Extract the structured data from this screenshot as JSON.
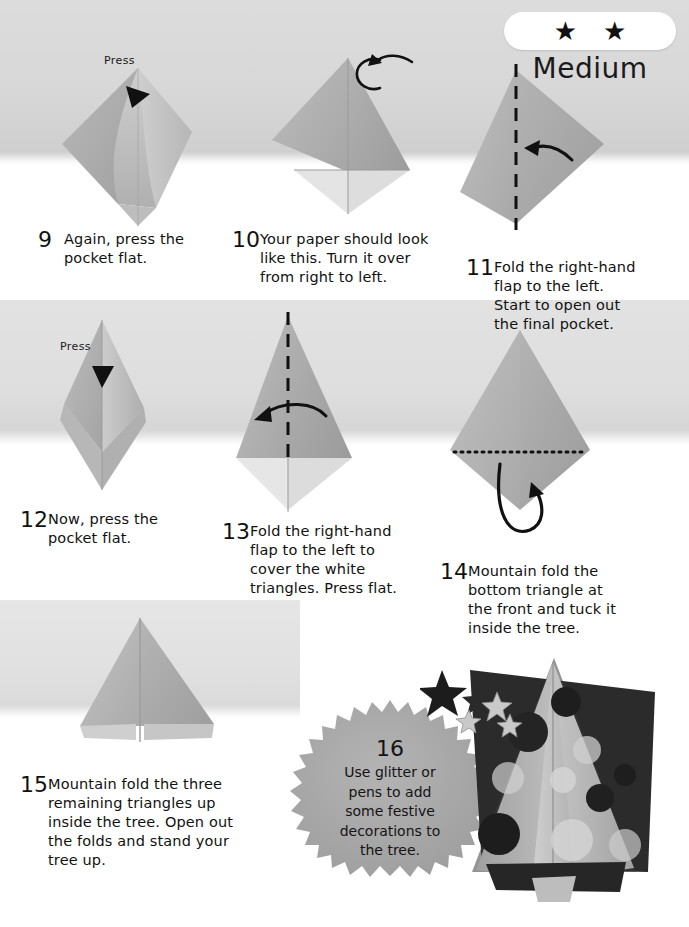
{
  "difficulty": {
    "label": "Medium",
    "stars": 2,
    "star_glyph": "★"
  },
  "steps": [
    {
      "number": "9",
      "text": "Again, press the\npocket flat.",
      "annotation": "Press"
    },
    {
      "number": "10",
      "text": "Your paper should look\nlike this. Turn it over\nfrom right to left.",
      "annotation": "turn-over-arrow"
    },
    {
      "number": "11",
      "text": "Fold the right-hand\nflap to the left.\nStart to open out\nthe final pocket.",
      "annotation": "valley-fold-line"
    },
    {
      "number": "12",
      "text": "Now, press the\npocket flat.",
      "annotation": "Press"
    },
    {
      "number": "13",
      "text": "Fold the right-hand\nflap to the left to\ncover the white\ntriangles. Press flat.",
      "annotation": "valley-fold-line"
    },
    {
      "number": "14",
      "text": "Mountain fold the\nbottom triangle at\nthe front and tuck it\ninside the tree.",
      "annotation": "mountain-fold-line"
    },
    {
      "number": "15",
      "text": "Mountain fold the three\nremaining triangles up\ninside the tree. Open out\nthe folds and stand your\ntree up.",
      "annotation": ""
    }
  ],
  "callout": {
    "number": "16",
    "text": "Use glitter or\npens to add\nsome festive\ndecorations to\nthe tree."
  },
  "colors": {
    "paper_light": "#c9c9c9",
    "paper_mid": "#b4b4b4",
    "paper_dark": "#9b9b9b",
    "paper_white": "#e9e9e9",
    "backdrop": "#d8d8d8",
    "ink": "#111111",
    "callout_fill": "#a9a9a9",
    "photo_dark": "#2a2a2a"
  },
  "labels": {
    "press": "Press"
  }
}
